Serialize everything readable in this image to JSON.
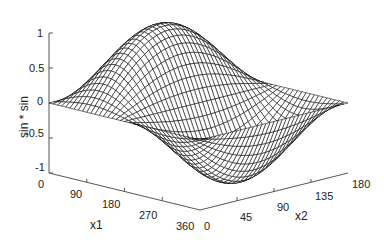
{
  "chart_data": {
    "type": "surface",
    "title": "",
    "function": "sin(x1) * sin(x2)",
    "xlabel": "x1",
    "ylabel": "x2",
    "zlabel": "sin * sin",
    "x1_range": [
      0,
      360
    ],
    "x2_range": [
      0,
      180
    ],
    "z_range": [
      -1,
      1
    ],
    "x1_ticks": [
      0,
      90,
      180,
      270,
      360
    ],
    "x2_ticks": [
      0,
      45,
      90,
      135,
      180
    ],
    "z_ticks": [
      -1,
      -0.5,
      0,
      0.5,
      1
    ],
    "z_tick_labels": [
      "-1",
      "-0.5",
      "0",
      "0.5",
      "1"
    ],
    "grid": {
      "x1_steps": 36,
      "x2_steps": 36
    },
    "mesh_color": "#000000",
    "face_color": "#ffffff",
    "surface_samples": [
      {
        "x1": 0,
        "x2": 90,
        "z": 0
      },
      {
        "x1": 90,
        "x2": 90,
        "z": 1
      },
      {
        "x1": 180,
        "x2": 90,
        "z": 0
      },
      {
        "x1": 270,
        "x2": 90,
        "z": -1
      },
      {
        "x1": 360,
        "x2": 90,
        "z": 0
      }
    ]
  },
  "labels": {
    "x1_axis": "x1",
    "x2_axis": "x2",
    "z_axis": "sin * sin",
    "x1_tick_0": "0",
    "x1_tick_1": "90",
    "x1_tick_2": "180",
    "x1_tick_3": "270",
    "x1_tick_4": "360",
    "x2_tick_0": "0",
    "x2_tick_1": "45",
    "x2_tick_2": "90",
    "x2_tick_3": "135",
    "x2_tick_4": "180",
    "z_tick_0": "1",
    "z_tick_1": "0.5",
    "z_tick_2": "0",
    "z_tick_3": "-0.5",
    "z_tick_4": "-1"
  }
}
